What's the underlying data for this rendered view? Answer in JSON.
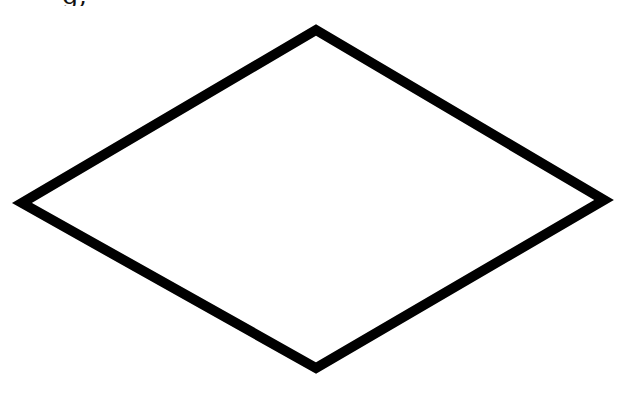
{
  "caption": {
    "fragment": "g,",
    "clipped": true
  },
  "shape": {
    "type": "rhombus",
    "stroke_color": "#000000",
    "fill_color": "#ffffff",
    "stroke_width": 10,
    "vertices": {
      "top": [
        316,
        30
      ],
      "right": [
        604,
        200
      ],
      "bottom": [
        316,
        368
      ],
      "left": [
        22,
        203
      ]
    }
  }
}
